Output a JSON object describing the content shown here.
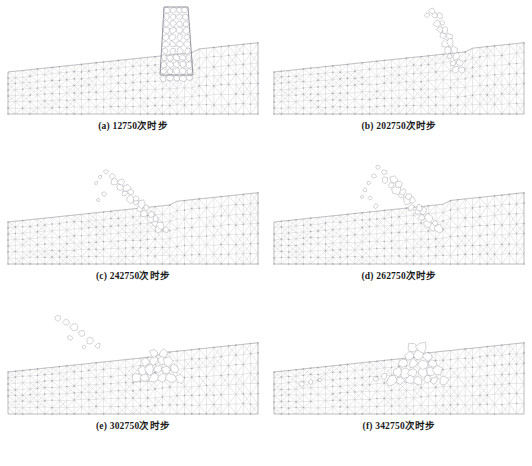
{
  "figure": {
    "title": "",
    "layout": {
      "columns": 2,
      "rows": 3
    },
    "colors": {
      "mesh_line": "#b9b9bd",
      "mesh_node": "#8e8e96",
      "block_outline": "#a9a9b0",
      "wall_outline": "#6f6f78",
      "background": "#ffffff",
      "caption_text": "#1a1a1a"
    }
  },
  "panels": [
    {
      "id": "a",
      "caption": "(a) 12750次时步",
      "label": "a",
      "timestep": "12750",
      "unit": "次时步",
      "state": "intact-wall"
    },
    {
      "id": "b",
      "caption": "(b) 202750次时步",
      "label": "b",
      "timestep": "202750",
      "unit": "次时步",
      "state": "wall-tilting"
    },
    {
      "id": "c",
      "caption": "(c) 242750次时步",
      "label": "c",
      "timestep": "242750",
      "unit": "次时步",
      "state": "wall-buckling"
    },
    {
      "id": "d",
      "caption": "(d) 262750次时步",
      "label": "d",
      "timestep": "262750",
      "unit": "次时步",
      "state": "blocks-separating"
    },
    {
      "id": "e",
      "caption": "(e) 302750次时步",
      "label": "e",
      "timestep": "302750",
      "unit": "次时步",
      "state": "blocks-ejected"
    },
    {
      "id": "f",
      "caption": "(f) 342750次时步",
      "label": "f",
      "timestep": "342750",
      "unit": "次时步",
      "state": "rubble-pile"
    }
  ],
  "chart_data": {
    "type": "diagram",
    "series": [
      {
        "name": "panel-a",
        "timestep": 12750,
        "wall_intact_fraction": 1.0,
        "ejected_blocks": 0
      },
      {
        "name": "panel-b",
        "timestep": 202750,
        "wall_intact_fraction": 0.7,
        "ejected_blocks": 2
      },
      {
        "name": "panel-c",
        "timestep": 242750,
        "wall_intact_fraction": 0.45,
        "ejected_blocks": 5
      },
      {
        "name": "panel-d",
        "timestep": 262750,
        "wall_intact_fraction": 0.3,
        "ejected_blocks": 8
      },
      {
        "name": "panel-e",
        "timestep": 302750,
        "wall_intact_fraction": 0.1,
        "ejected_blocks": 12
      },
      {
        "name": "panel-f",
        "timestep": 342750,
        "wall_intact_fraction": 0.0,
        "ejected_blocks": 16
      }
    ],
    "categories": [
      "12750",
      "202750",
      "242750",
      "262750",
      "302750",
      "342750"
    ],
    "xlabel": "时步",
    "ylabel": "",
    "legend_position": "none",
    "grid": false
  }
}
